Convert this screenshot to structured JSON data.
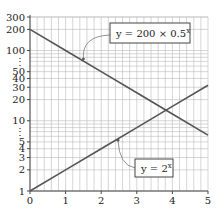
{
  "chart_data": {
    "type": "line",
    "title": "",
    "xlabel": "",
    "ylabel": "",
    "x_scale": "linear",
    "y_scale": "log",
    "xlim": [
      0,
      5
    ],
    "ylim": [
      1,
      300
    ],
    "grid": true,
    "x_ticks": [
      "0",
      "1",
      "2",
      "3",
      "4",
      "5"
    ],
    "y_ticks": [
      "1",
      "2",
      "3",
      "4",
      "5",
      "⋮",
      "10",
      "20",
      "30",
      "40",
      "50",
      "⋮",
      "100",
      "200",
      "300"
    ],
    "y_tick_values": [
      1,
      2,
      3,
      4,
      5,
      null,
      10,
      20,
      30,
      40,
      50,
      null,
      100,
      200,
      300
    ],
    "series": [
      {
        "name": "y = 200 × 0.5^x",
        "label_main": "y = 200 × 0.5",
        "label_exp": "x",
        "x": [
          0,
          1,
          2,
          3,
          4,
          5
        ],
        "values": [
          200,
          100,
          50,
          25,
          12.5,
          6.25
        ],
        "color": "#555555",
        "legend": "annotation-top-right"
      },
      {
        "name": "y = 2^x",
        "label_main": "y = 2",
        "label_exp": "x",
        "x": [
          0,
          1,
          2,
          3,
          4,
          5
        ],
        "values": [
          1,
          2,
          4,
          8,
          16,
          32
        ],
        "color": "#555555",
        "legend": "annotation-bottom-right"
      }
    ],
    "colors": {
      "line": "#555555",
      "grid": "#bbbbbb",
      "axis": "#444444",
      "text": "#222222"
    }
  }
}
